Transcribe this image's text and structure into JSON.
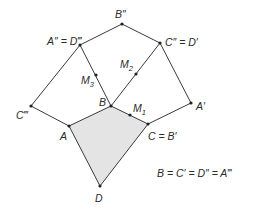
{
  "diagram": {
    "points": {
      "B2": {
        "label": "B″"
      },
      "A2": {
        "label": "A″ = D‴"
      },
      "C2": {
        "label": "C″ = D′"
      },
      "M3": {
        "label": "M",
        "sub": "3"
      },
      "M2": {
        "label": "M",
        "sub": "2"
      },
      "M1": {
        "label": "M",
        "sub": "1"
      },
      "B": {
        "label": "B"
      },
      "C3": {
        "label": "C‴"
      },
      "A": {
        "label": "A"
      },
      "C": {
        "label": "C = B′"
      },
      "A1": {
        "label": "A′"
      },
      "D": {
        "label": "D"
      }
    },
    "note": "B = C′ = D″ = A‴",
    "shaded_quadrilateral": [
      "A",
      "B",
      "C",
      "D"
    ],
    "shade_color": "#e4e4e4",
    "line_color": "#3a3a3a"
  }
}
